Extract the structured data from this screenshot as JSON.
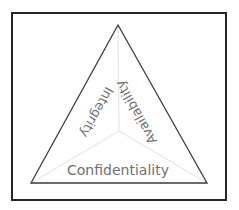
{
  "diagram": {
    "sides": {
      "left": "Integrity",
      "right": "Availability",
      "bottom": "Confidentiality"
    },
    "colors": {
      "frame": "#262626",
      "triangle": "#3a3a3a",
      "dividers": "#e2e2e2",
      "text": "#707070"
    }
  }
}
